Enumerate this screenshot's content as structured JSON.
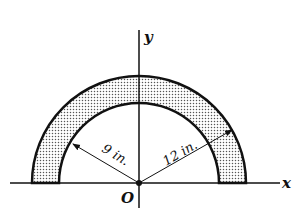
{
  "diagram": {
    "type": "semicircular-ring",
    "inner_radius_label": "9 in.",
    "outer_radius_label": "12 in.",
    "axis_x_label": "x",
    "axis_y_label": "y",
    "origin_label": "O",
    "fill_pattern": "stippled",
    "colors": {
      "stroke": "#111111",
      "fill_dots": "#555555",
      "background": "#ffffff"
    }
  }
}
